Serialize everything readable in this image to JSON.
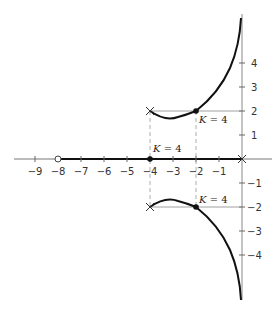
{
  "diagram": {
    "type": "root-locus",
    "axes": {
      "x_ticks": [
        {
          "value": -9,
          "label": "−9"
        },
        {
          "value": -8,
          "label": "−8"
        },
        {
          "value": -7,
          "label": "−7"
        },
        {
          "value": -6,
          "label": "−6"
        },
        {
          "value": -5,
          "label": "−5"
        },
        {
          "value": -4,
          "label": "−4"
        },
        {
          "value": -3,
          "label": "−3"
        },
        {
          "value": -2,
          "label": "−2"
        },
        {
          "value": -1,
          "label": "−1"
        }
      ],
      "y_ticks": [
        {
          "value": 4,
          "label": "4"
        },
        {
          "value": 3,
          "label": "3"
        },
        {
          "value": 2,
          "label": "2"
        },
        {
          "value": 1,
          "label": "1"
        },
        {
          "value": -1,
          "label": "−1"
        },
        {
          "value": -2,
          "label": "−2"
        },
        {
          "value": -3,
          "label": "−3"
        },
        {
          "value": -4,
          "label": "−4"
        }
      ]
    },
    "poles": [
      {
        "re": -4,
        "im": 2,
        "marker": "x"
      },
      {
        "re": -4,
        "im": -2,
        "marker": "x"
      },
      {
        "re": 0,
        "im": 0,
        "marker": "x"
      }
    ],
    "zeros": [
      {
        "re": -8,
        "im": 0,
        "marker": "open-circle"
      }
    ],
    "gain_points": [
      {
        "re": -2,
        "im": 2,
        "label_k": "K",
        "label_eq": " = 4"
      },
      {
        "re": -4,
        "im": 0,
        "label_k": "K",
        "label_eq": " = 4"
      },
      {
        "re": -2,
        "im": -2,
        "label_k": "K",
        "label_eq": " = 4"
      }
    ],
    "colors": {
      "axis": "#777777",
      "locus": "#111111",
      "dashed": "#999999"
    }
  }
}
